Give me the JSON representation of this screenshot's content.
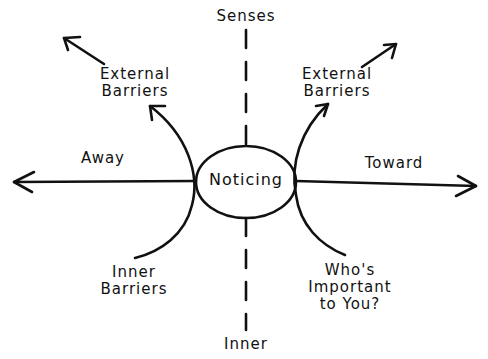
{
  "diagram": {
    "center": {
      "label": "Noticing"
    },
    "axes": {
      "top": "Senses",
      "bottom": "Inner",
      "left": "Away",
      "right": "Toward"
    },
    "quadrants": {
      "top_left": "External\nBarriers",
      "top_right": "External\nBarriers",
      "bottom_left": "Inner\nBarriers",
      "bottom_right": "Who's\nImportant\nto You?"
    },
    "colors": {
      "ink": "#111111",
      "background": "#ffffff"
    }
  }
}
